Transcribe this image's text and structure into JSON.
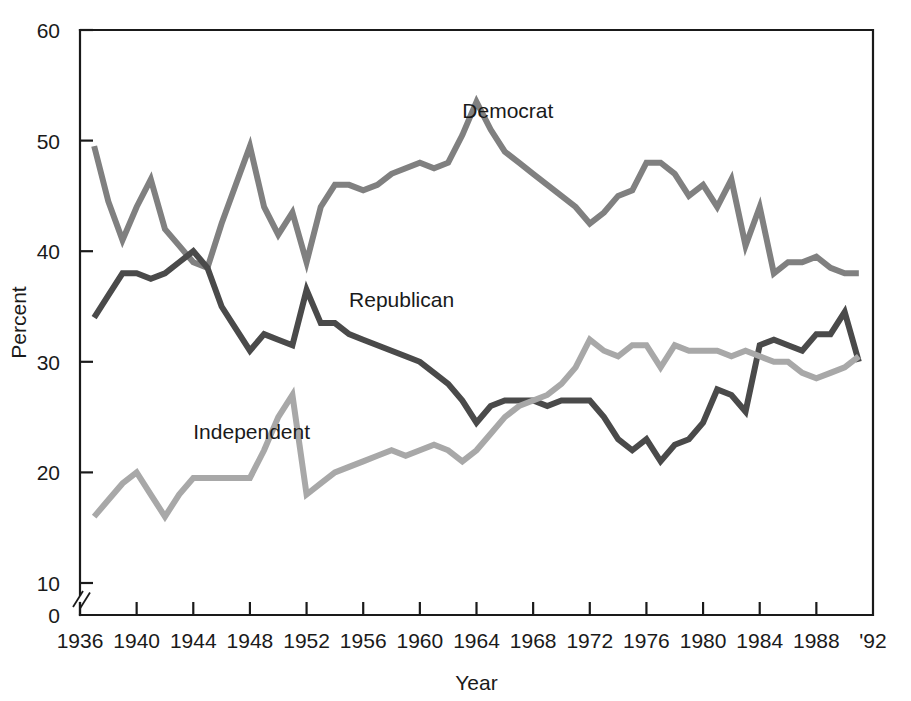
{
  "chart_data": {
    "type": "line",
    "title": "",
    "xlabel": "Year",
    "ylabel": "Percent",
    "xlim": [
      1936,
      1992
    ],
    "ylim": [
      0,
      60
    ],
    "y_axis_break": true,
    "y_axis_break_note": "axis broken between 0 and 10",
    "grid": false,
    "legend_position": "inline-labels",
    "x_ticks": [
      1936,
      1940,
      1944,
      1948,
      1952,
      1956,
      1960,
      1964,
      1968,
      1972,
      1976,
      1980,
      1984,
      1988,
      1992
    ],
    "x_tick_labels": [
      "1936",
      "1940",
      "1944",
      "1948",
      "1952",
      "1956",
      "1960",
      "1964",
      "1968",
      "1972",
      "1976",
      "1980",
      "1984",
      "1988",
      "'92"
    ],
    "y_ticks": [
      0,
      10,
      20,
      30,
      40,
      50,
      60
    ],
    "y_tick_labels": [
      "0",
      "10",
      "20",
      "30",
      "40",
      "50",
      "60"
    ],
    "x": [
      1937,
      1938,
      1939,
      1940,
      1941,
      1942,
      1943,
      1944,
      1945,
      1946,
      1947,
      1948,
      1949,
      1950,
      1951,
      1952,
      1953,
      1954,
      1955,
      1956,
      1957,
      1958,
      1959,
      1960,
      1961,
      1962,
      1963,
      1964,
      1965,
      1966,
      1967,
      1968,
      1969,
      1970,
      1971,
      1972,
      1973,
      1974,
      1975,
      1976,
      1977,
      1978,
      1979,
      1980,
      1981,
      1982,
      1983,
      1984,
      1985,
      1986,
      1987,
      1988,
      1989,
      1990,
      1991
    ],
    "series": [
      {
        "name": "Democrat",
        "color": "#808080",
        "label_x": 1963,
        "label_y": 52,
        "values": [
          49.5,
          44.5,
          41.0,
          44.0,
          46.5,
          42.0,
          40.5,
          39.0,
          38.5,
          42.5,
          46.0,
          49.5,
          44.0,
          41.5,
          43.5,
          39.0,
          44.0,
          46.0,
          46.0,
          45.5,
          46.0,
          47.0,
          47.5,
          48.0,
          47.5,
          48.0,
          50.5,
          53.5,
          51.0,
          49.0,
          48.0,
          47.0,
          46.0,
          45.0,
          44.0,
          42.5,
          43.5,
          45.0,
          45.5,
          48.0,
          48.0,
          47.0,
          45.0,
          46.0,
          44.0,
          46.5,
          40.5,
          44.0,
          38.0,
          39.0,
          39.0,
          39.5,
          38.5,
          38.0,
          38.0
        ]
      },
      {
        "name": "Republican",
        "color": "#4a4a4a",
        "label_x": 1955,
        "label_y": 35,
        "values": [
          34.0,
          36.0,
          38.0,
          38.0,
          37.5,
          38.0,
          39.0,
          40.0,
          38.5,
          35.0,
          33.0,
          31.0,
          32.5,
          32.0,
          31.5,
          36.5,
          33.5,
          33.5,
          32.5,
          32.0,
          31.5,
          31.0,
          30.5,
          30.0,
          29.0,
          28.0,
          26.5,
          24.5,
          26.0,
          26.5,
          26.5,
          26.5,
          26.0,
          26.5,
          26.5,
          26.5,
          25.0,
          23.0,
          22.0,
          23.0,
          21.0,
          22.5,
          23.0,
          24.5,
          27.5,
          27.0,
          25.5,
          31.5,
          32.0,
          31.5,
          31.0,
          32.5,
          32.5,
          34.5,
          30.0
        ]
      },
      {
        "name": "Independent",
        "color": "#a8a8a8",
        "label_x": 1944,
        "label_y": 23,
        "values": [
          16.0,
          17.5,
          19.0,
          20.0,
          18.0,
          16.0,
          18.0,
          19.5,
          19.5,
          19.5,
          19.5,
          19.5,
          22.0,
          25.0,
          27.0,
          18.0,
          19.0,
          20.0,
          20.5,
          21.0,
          21.5,
          22.0,
          21.5,
          22.0,
          22.5,
          22.0,
          21.0,
          22.0,
          23.5,
          25.0,
          26.0,
          26.5,
          27.0,
          28.0,
          29.5,
          32.0,
          31.0,
          30.5,
          31.5,
          31.5,
          29.5,
          31.5,
          31.0,
          31.0,
          31.0,
          30.5,
          31.0,
          30.5,
          30.0,
          30.0,
          29.0,
          28.5,
          29.0,
          29.5,
          30.5
        ]
      }
    ]
  },
  "labels": {
    "democrat": "Democrat",
    "republican": "Republican",
    "independent": "Independent",
    "xlabel": "Year",
    "ylabel": "Percent"
  }
}
